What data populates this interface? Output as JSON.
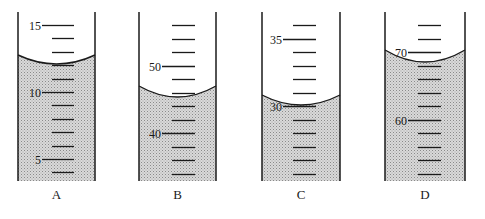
{
  "figure": {
    "colors": {
      "background": "#ffffff",
      "ink": "#1a1a1a",
      "liquid_fill": "#d6d6d6",
      "liquid_dots": "#8a8a8a"
    }
  },
  "cylinders": [
    {
      "label": "A",
      "x_left": 18,
      "x_right": 95,
      "tick_x1": 52,
      "tick_x2": 74,
      "top_value": 15,
      "tick_step": 1,
      "first_tick_y": 25,
      "tick_spacing": 13.4,
      "tick_count": 12,
      "labeled_ticks": [
        {
          "value": "15",
          "index": 0
        },
        {
          "value": "10",
          "index": 5
        },
        {
          "value": "5",
          "index": 10
        }
      ],
      "meniscus_edge_y": 55,
      "meniscus_bottom_y": 64,
      "reading_ml": 12.2
    },
    {
      "label": "B",
      "x_left": 139,
      "x_right": 216,
      "tick_x1": 172,
      "tick_x2": 195,
      "top_value": 56,
      "tick_step": 2,
      "first_tick_y": 25,
      "tick_spacing": 13.5,
      "tick_count": 12,
      "labeled_ticks": [
        {
          "value": "50",
          "index": 3
        },
        {
          "value": "40",
          "index": 8
        }
      ],
      "meniscus_edge_y": 86,
      "meniscus_bottom_y": 97,
      "reading_ml": 45
    },
    {
      "label": "C",
      "x_left": 262,
      "x_right": 340,
      "tick_x1": 293,
      "tick_x2": 316,
      "top_value": 36,
      "tick_step": 1,
      "first_tick_y": 25,
      "tick_spacing": 13.5,
      "tick_count": 12,
      "labeled_ticks": [
        {
          "value": "35",
          "index": 1
        },
        {
          "value": "30",
          "index": 6
        }
      ],
      "meniscus_edge_y": 95,
      "meniscus_bottom_y": 105,
      "reading_ml": 30.0
    },
    {
      "label": "D",
      "x_left": 385,
      "x_right": 465,
      "tick_x1": 418,
      "tick_x2": 441,
      "top_value": 74,
      "tick_step": 2,
      "first_tick_y": 25,
      "tick_spacing": 13.5,
      "tick_count": 12,
      "labeled_ticks": [
        {
          "value": "70",
          "index": 2
        },
        {
          "value": "60",
          "index": 7
        }
      ],
      "meniscus_edge_y": 50,
      "meniscus_bottom_y": 62,
      "reading_ml": 68.8
    }
  ],
  "layout": {
    "wall_top_y": 12,
    "bottom_y": 181,
    "label_y": 199
  }
}
